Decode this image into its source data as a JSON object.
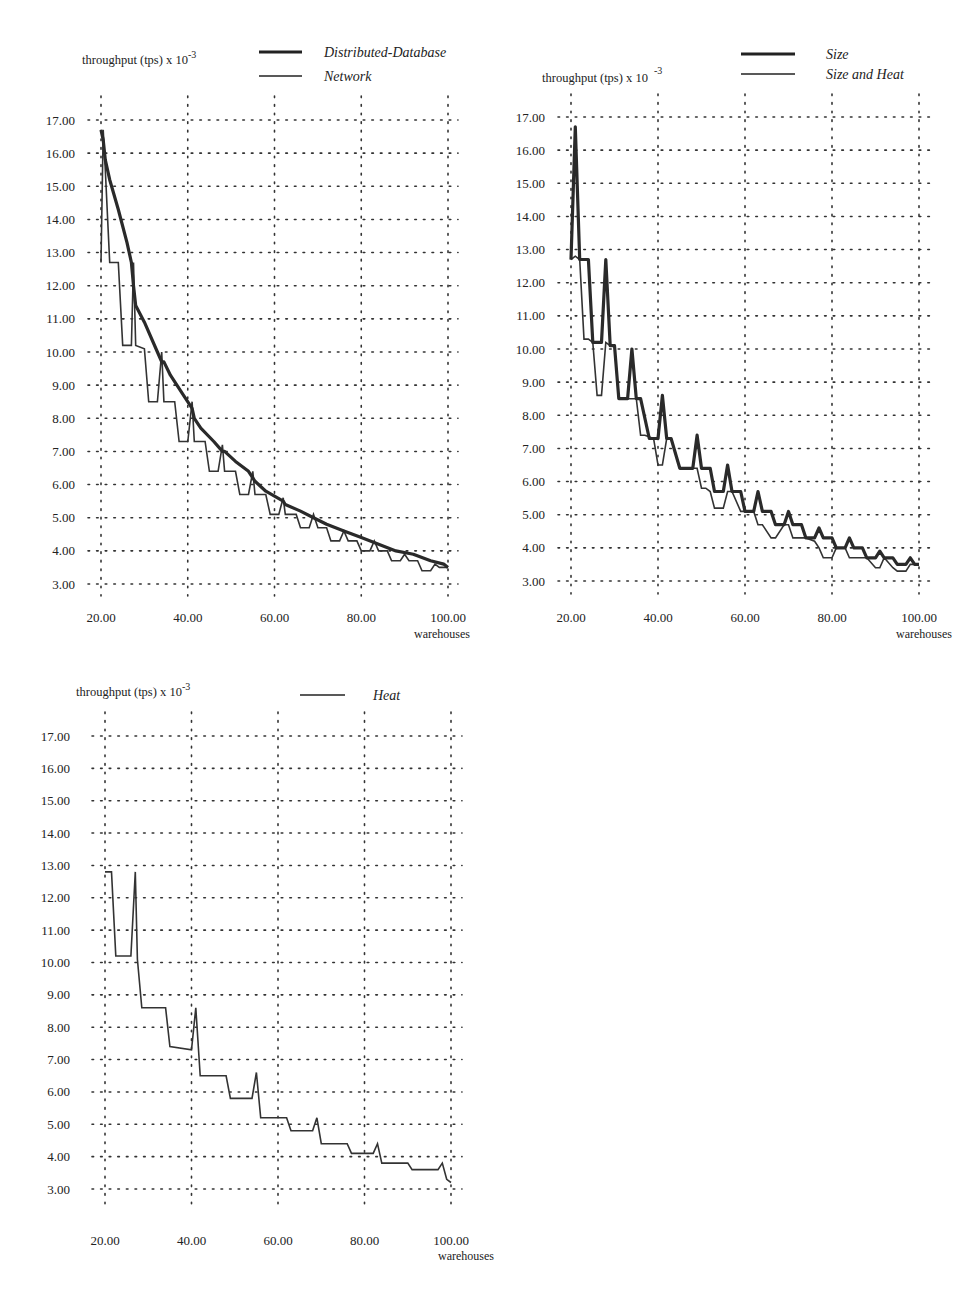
{
  "charts": [
    {
      "id": "top-left",
      "ylabel": "throughput (tps) x 10",
      "ylabel_exp": "-3",
      "xlabel": "warehouses",
      "legend": [
        {
          "label": "Distributed-Database",
          "style": "thick"
        },
        {
          "label": "Network",
          "style": "thin"
        }
      ],
      "x_ticks": [
        "20.00",
        "40.00",
        "60.00",
        "80.00",
        "100.00"
      ],
      "y_ticks": [
        "17.00",
        "16.00",
        "15.00",
        "14.00",
        "13.00",
        "12.00",
        "11.00",
        "10.00",
        "9.00",
        "8.00",
        "7.00",
        "6.00",
        "5.00",
        "4.00",
        "3.00"
      ]
    },
    {
      "id": "top-right",
      "ylabel": "throughput (tps) x 10",
      "ylabel_exp": "-3",
      "xlabel": "warehouses",
      "legend": [
        {
          "label": "Size",
          "style": "thick"
        },
        {
          "label": "Size and Heat",
          "style": "thin"
        }
      ],
      "x_ticks": [
        "20.00",
        "40.00",
        "60.00",
        "80.00",
        "100.00"
      ],
      "y_ticks": [
        "17.00",
        "16.00",
        "15.00",
        "14.00",
        "13.00",
        "12.00",
        "11.00",
        "10.00",
        "9.00",
        "8.00",
        "7.00",
        "6.00",
        "5.00",
        "4.00",
        "3.00"
      ]
    },
    {
      "id": "bottom-left",
      "ylabel": "throughput (tps) x 10",
      "ylabel_exp": "-3",
      "xlabel": "warehouses",
      "legend": [
        {
          "label": "Heat",
          "style": "thin"
        }
      ],
      "x_ticks": [
        "20.00",
        "40.00",
        "60.00",
        "80.00",
        "100.00"
      ],
      "y_ticks": [
        "17.00",
        "16.00",
        "15.00",
        "14.00",
        "13.00",
        "12.00",
        "11.00",
        "10.00",
        "9.00",
        "8.00",
        "7.00",
        "6.00",
        "5.00",
        "4.00",
        "3.00"
      ]
    }
  ],
  "chart_data": [
    {
      "type": "line",
      "title": "",
      "xlabel": "warehouses",
      "ylabel": "throughput (tps) x 10^-3",
      "xlim": [
        20,
        100
      ],
      "ylim": [
        3,
        17
      ],
      "grid": true,
      "legend_position": "top-right",
      "series": [
        {
          "name": "Distributed-Database",
          "style": "thick",
          "x": [
            20,
            20.5,
            21,
            22,
            24,
            26,
            27,
            27.5,
            28,
            30,
            33,
            34,
            34.5,
            36,
            39,
            41,
            41.5,
            43,
            46,
            48,
            48.5,
            51,
            54,
            55,
            55.5,
            58,
            62,
            62.5,
            66,
            69,
            72,
            76,
            80,
            84,
            88,
            92,
            96,
            99,
            100
          ],
          "y": [
            16.7,
            16.4,
            15.8,
            15.2,
            14.3,
            13.3,
            12.7,
            12.0,
            11.4,
            10.9,
            10.0,
            9.7,
            9.7,
            9.3,
            8.7,
            8.3,
            8.0,
            7.7,
            7.3,
            7.0,
            7.0,
            6.7,
            6.4,
            6.2,
            6.1,
            5.8,
            5.5,
            5.4,
            5.2,
            5.0,
            4.8,
            4.6,
            4.4,
            4.2,
            4.0,
            3.9,
            3.7,
            3.6,
            3.5
          ]
        },
        {
          "name": "Network",
          "style": "thin",
          "x": [
            20,
            20.5,
            21,
            22,
            24,
            25,
            27,
            27.5,
            28,
            30,
            31,
            33,
            34,
            34.5,
            35,
            37,
            38,
            40,
            41,
            41.5,
            42,
            44,
            45,
            47,
            48,
            48.5,
            49,
            51,
            52,
            54,
            55,
            55.5,
            56,
            58,
            59,
            61,
            62,
            62.5,
            63,
            65,
            66,
            68,
            69,
            70,
            72,
            73,
            75,
            76,
            77,
            79,
            80,
            82,
            83,
            84,
            86,
            87,
            89,
            90,
            91,
            93,
            94,
            96,
            97,
            98,
            100
          ],
          "y": [
            12.7,
            16.7,
            15.5,
            12.7,
            12.7,
            10.2,
            10.2,
            12.7,
            10.2,
            10.1,
            8.5,
            8.5,
            10.0,
            8.5,
            8.5,
            8.5,
            7.3,
            7.3,
            8.5,
            7.3,
            7.3,
            7.3,
            6.4,
            6.4,
            7.2,
            6.4,
            6.4,
            6.4,
            5.7,
            5.7,
            6.4,
            5.7,
            5.7,
            5.7,
            5.1,
            5.1,
            5.6,
            5.1,
            5.1,
            5.1,
            4.7,
            4.7,
            5.1,
            4.7,
            4.7,
            4.3,
            4.3,
            4.6,
            4.3,
            4.3,
            4.0,
            4.0,
            4.3,
            4.0,
            4.0,
            3.7,
            3.7,
            3.9,
            3.7,
            3.7,
            3.4,
            3.4,
            3.6,
            3.5,
            3.5
          ]
        }
      ]
    },
    {
      "type": "line",
      "title": "",
      "xlabel": "warehouses",
      "ylabel": "throughput (tps) x 10^-3",
      "xlim": [
        20,
        100
      ],
      "ylim": [
        3,
        17
      ],
      "grid": true,
      "legend_position": "top-right",
      "series": [
        {
          "name": "Size",
          "style": "thick",
          "x": [
            20,
            21,
            22,
            24,
            25,
            26,
            27,
            28,
            29,
            30,
            31,
            33,
            34,
            35,
            36,
            38,
            39,
            40,
            41,
            42,
            43,
            45,
            46,
            48,
            49,
            50,
            52,
            53,
            55,
            56,
            57,
            59,
            60,
            62,
            63,
            64,
            66,
            67,
            69,
            70,
            71,
            73,
            74,
            76,
            77,
            78,
            80,
            81,
            83,
            84,
            85,
            87,
            88,
            90,
            91,
            92,
            94,
            95,
            97,
            98,
            99,
            100
          ],
          "y": [
            12.7,
            16.7,
            12.7,
            12.7,
            10.2,
            10.2,
            10.2,
            12.7,
            10.1,
            10.1,
            8.5,
            8.5,
            10.0,
            8.5,
            8.5,
            7.3,
            7.3,
            7.3,
            8.6,
            7.3,
            7.3,
            6.4,
            6.4,
            6.4,
            7.4,
            6.4,
            6.4,
            5.7,
            5.7,
            6.5,
            5.7,
            5.7,
            5.1,
            5.1,
            5.7,
            5.1,
            5.1,
            4.7,
            4.7,
            5.1,
            4.7,
            4.7,
            4.3,
            4.3,
            4.6,
            4.3,
            4.3,
            4.0,
            4.0,
            4.3,
            4.0,
            4.0,
            3.7,
            3.7,
            3.9,
            3.7,
            3.7,
            3.5,
            3.5,
            3.7,
            3.5,
            3.5
          ]
        },
        {
          "name": "Size and Heat",
          "style": "thin",
          "x": [
            20,
            21,
            22,
            23,
            24,
            25,
            26,
            27,
            28,
            29,
            30,
            31,
            33,
            34,
            35,
            36,
            37,
            39,
            40,
            41,
            42,
            43,
            45,
            46,
            48,
            49,
            50,
            51,
            52,
            53,
            55,
            56,
            57,
            59,
            60,
            62,
            63,
            64,
            66,
            67,
            69,
            70,
            71,
            73,
            74,
            76,
            77,
            78,
            80,
            81,
            83,
            84,
            85,
            87,
            88,
            90,
            91,
            92,
            94,
            95,
            97,
            98,
            99,
            100
          ],
          "y": [
            12.7,
            12.8,
            12.7,
            10.3,
            10.3,
            10.2,
            8.6,
            8.6,
            10.2,
            10.1,
            10.1,
            8.5,
            8.5,
            8.5,
            8.5,
            7.4,
            7.4,
            7.3,
            6.5,
            6.5,
            7.3,
            7.3,
            6.4,
            6.4,
            6.4,
            6.4,
            5.8,
            5.8,
            5.7,
            5.2,
            5.2,
            5.7,
            5.7,
            5.1,
            5.1,
            5.1,
            4.7,
            4.7,
            4.3,
            4.3,
            4.7,
            4.7,
            4.3,
            4.3,
            4.3,
            4.2,
            4.0,
            3.7,
            3.7,
            4.0,
            4.0,
            3.7,
            3.7,
            3.7,
            3.7,
            3.4,
            3.4,
            3.7,
            3.4,
            3.3,
            3.3,
            3.5,
            3.5,
            3.5
          ]
        }
      ]
    },
    {
      "type": "line",
      "title": "",
      "xlabel": "warehouses",
      "ylabel": "throughput (tps) x 10^-3",
      "xlim": [
        20,
        100
      ],
      "ylim": [
        3,
        17
      ],
      "grid": true,
      "legend_position": "top-right",
      "series": [
        {
          "name": "Heat",
          "style": "thin",
          "x": [
            20,
            21.5,
            22.5,
            26,
            27,
            27.5,
            28.5,
            34,
            35,
            40,
            41,
            42,
            48,
            49,
            54,
            55,
            56,
            62,
            63,
            68,
            69,
            70,
            76,
            77,
            82,
            83,
            84,
            90,
            91,
            97,
            98,
            99,
            100
          ],
          "y": [
            12.8,
            12.8,
            10.2,
            10.2,
            12.8,
            10.1,
            8.6,
            8.6,
            7.4,
            7.3,
            8.6,
            6.5,
            6.5,
            5.8,
            5.8,
            6.6,
            5.2,
            5.2,
            4.8,
            4.8,
            5.2,
            4.4,
            4.4,
            4.1,
            4.1,
            4.4,
            3.8,
            3.8,
            3.6,
            3.6,
            3.8,
            3.3,
            3.2
          ]
        }
      ]
    }
  ]
}
